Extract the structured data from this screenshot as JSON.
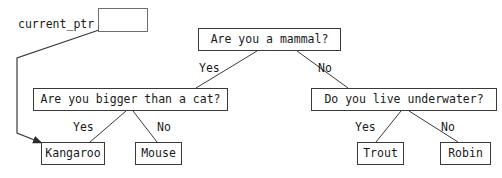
{
  "canvas": {
    "width": 502,
    "height": 178,
    "background": "#ffffff"
  },
  "style": {
    "stroke": "#3a3a3a",
    "ptr_stroke": "#6e6e6e",
    "text": "#1a1a1a",
    "node_font_size": 11.5,
    "label_font_size": 11.5
  },
  "pointer": {
    "variable_label": "current_ptr",
    "variable_label_x": 18,
    "variable_label_y": 19,
    "box": {
      "x": 98,
      "y": 8,
      "width": 50,
      "height": 24
    },
    "slash_from": {
      "x": 99,
      "y": 30
    },
    "slash_to": {
      "x": 139,
      "y": 16
    },
    "arrow_path": [
      {
        "x": 99,
        "y": 30
      },
      {
        "x": 17,
        "y": 58
      },
      {
        "x": 17,
        "y": 133
      },
      {
        "x": 42,
        "y": 143
      }
    ],
    "arrow_target_node": "kangaroo"
  },
  "nodes": [
    {
      "id": "root-mammal",
      "label": "Are you a mammal?",
      "kind": "question",
      "x": 198,
      "y": 28,
      "width": 143,
      "height": 23
    },
    {
      "id": "bigger-than-cat",
      "label": "Are you bigger than a cat?",
      "kind": "question",
      "x": 33,
      "y": 88,
      "width": 195,
      "height": 23
    },
    {
      "id": "live-underwater",
      "label": "Do you live underwater?",
      "kind": "question",
      "x": 311,
      "y": 88,
      "width": 186,
      "height": 23
    },
    {
      "id": "kangaroo",
      "label": "Kangaroo",
      "kind": "leaf",
      "x": 41,
      "y": 142,
      "width": 64,
      "height": 23
    },
    {
      "id": "mouse",
      "label": "Mouse",
      "kind": "leaf",
      "x": 135,
      "y": 142,
      "width": 47,
      "height": 23
    },
    {
      "id": "trout",
      "label": "Trout",
      "kind": "leaf",
      "x": 357,
      "y": 142,
      "width": 47,
      "height": 23
    },
    {
      "id": "robin",
      "label": "Robin",
      "kind": "leaf",
      "x": 440,
      "y": 142,
      "width": 51,
      "height": 23
    }
  ],
  "edges": [
    {
      "id": "root-yes",
      "from": "root-mammal",
      "to": "bigger-than-cat",
      "label": "Yes",
      "x1": 257,
      "y1": 51,
      "x2": 196,
      "y2": 88,
      "label_x": 199,
      "label_y": 63
    },
    {
      "id": "root-no",
      "from": "root-mammal",
      "to": "live-underwater",
      "label": "No",
      "x1": 297,
      "y1": 51,
      "x2": 348,
      "y2": 88,
      "label_x": 318,
      "label_y": 63
    },
    {
      "id": "cat-yes",
      "from": "bigger-than-cat",
      "to": "kangaroo",
      "label": "Yes",
      "x1": 126,
      "y1": 111,
      "x2": 90,
      "y2": 142,
      "label_x": 73,
      "label_y": 122
    },
    {
      "id": "cat-no",
      "from": "bigger-than-cat",
      "to": "mouse",
      "label": "No",
      "x1": 133,
      "y1": 111,
      "x2": 157,
      "y2": 142,
      "label_x": 157,
      "label_y": 122
    },
    {
      "id": "water-yes",
      "from": "live-underwater",
      "to": "trout",
      "label": "Yes",
      "x1": 401,
      "y1": 111,
      "x2": 376,
      "y2": 142,
      "label_x": 355,
      "label_y": 122
    },
    {
      "id": "water-no",
      "from": "live-underwater",
      "to": "robin",
      "label": "No",
      "x1": 409,
      "y1": 111,
      "x2": 458,
      "y2": 142,
      "label_x": 441,
      "label_y": 122
    }
  ]
}
